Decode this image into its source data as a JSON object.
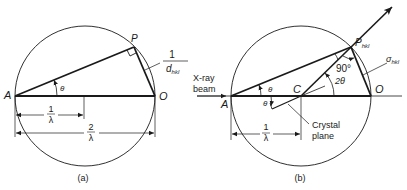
{
  "panel_a": {
    "caption": "(a)",
    "points": {
      "A": "A",
      "P": "P",
      "O": "O"
    },
    "angle_label": "θ",
    "d_label": {
      "numerator": "1",
      "denominator": "d",
      "subscript": "hkl"
    },
    "radius_label": {
      "numerator": "1",
      "denominator": "λ"
    },
    "diameter_label": {
      "numerator": "2",
      "denominator": "λ"
    }
  },
  "panel_b": {
    "caption": "(b)",
    "points": {
      "A": "A",
      "C": "C",
      "O": "O",
      "P": "P",
      "P_sub": "hkl"
    },
    "beam_label": [
      "X-ray",
      "beam"
    ],
    "angle_theta_upper": "θ",
    "angle_theta_lower": "θ",
    "angle_two_theta": "2θ",
    "right_angle_label": "90°",
    "sigma_label": {
      "symbol": "σ",
      "subscript": "hkl"
    },
    "radius_label": {
      "numerator": "1",
      "denominator": "λ"
    },
    "crystal_plane_label": [
      "Crystal",
      "plane"
    ]
  },
  "colors": {
    "ink": "#1a1a1a",
    "background": "#ffffff"
  }
}
